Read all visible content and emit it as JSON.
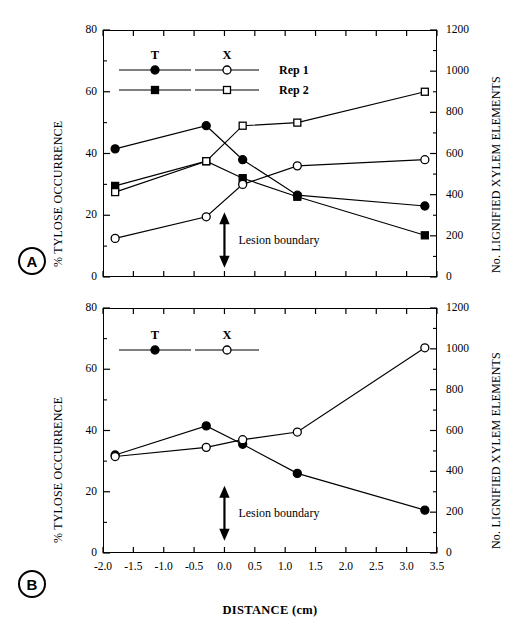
{
  "figure": {
    "panel_a_tag": "A",
    "panel_b_tag": "B",
    "x_axis_title": "DISTANCE (cm)",
    "y_left_title": "% TYLOSE OCCURRENCE",
    "y_right_title": "No. LIGNIFIED XYLEM ELEMENTS",
    "annotation": "Lesion boundary"
  },
  "legend_a": {
    "head_t": "T",
    "head_x": "X",
    "row1": "Rep 1",
    "row2": "Rep 2"
  },
  "legend_b": {
    "head_t": "T",
    "head_x": "X"
  },
  "axes": {
    "x_ticks": [
      "-2.0",
      "-1.5",
      "-1.0",
      "-0.5",
      "0.0",
      "0.5",
      "1.0",
      "1.5",
      "2.0",
      "2.5",
      "3.0",
      "3.5"
    ],
    "y_left_ticks": [
      "0",
      "20",
      "40",
      "60",
      "80"
    ],
    "y_right_ticks": [
      "0",
      "200",
      "400",
      "600",
      "800",
      "1000",
      "1200"
    ]
  },
  "chart_data": [
    {
      "type": "line",
      "panel": "A",
      "title": "",
      "xlabel": "DISTANCE (cm)",
      "ylabel": "% TYLOSE OCCURRENCE",
      "y2label": "No. LIGNIFIED XYLEM ELEMENTS",
      "xlim": [
        -2.0,
        3.5
      ],
      "ylim": [
        0,
        80
      ],
      "y2lim": [
        0,
        1200
      ],
      "grid": false,
      "legend_position": "upper-left-inside",
      "annotations": [
        {
          "text": "Lesion boundary",
          "x": 0.0,
          "type": "double-headed-vertical-arrow"
        }
      ],
      "x": [
        -1.8,
        -0.3,
        0.3,
        1.2,
        3.3
      ],
      "series": [
        {
          "name": "T Rep 1",
          "axis": "left",
          "marker": "filled-circle",
          "values": [
            41.5,
            49.0,
            38.0,
            26.5,
            23.0
          ]
        },
        {
          "name": "T Rep 2",
          "axis": "left",
          "marker": "filled-square",
          "values": [
            29.5,
            37.5,
            32.0,
            26.0,
            13.5
          ]
        },
        {
          "name": "X Rep 1",
          "axis": "right",
          "marker": "open-circle",
          "values": [
            12.5,
            19.5,
            30.0,
            36.0,
            38.0
          ]
        },
        {
          "name": "X Rep 2",
          "axis": "right",
          "marker": "open-square",
          "values": [
            27.5,
            37.5,
            49.0,
            50.0,
            60.0
          ]
        }
      ]
    },
    {
      "type": "line",
      "panel": "B",
      "title": "",
      "xlabel": "DISTANCE (cm)",
      "ylabel": "% TYLOSE OCCURRENCE",
      "y2label": "No. LIGNIFIED XYLEM ELEMENTS",
      "xlim": [
        -2.0,
        3.5
      ],
      "ylim": [
        0,
        80
      ],
      "y2lim": [
        0,
        1200
      ],
      "grid": false,
      "legend_position": "upper-left-inside",
      "annotations": [
        {
          "text": "Lesion boundary",
          "x": 0.0,
          "type": "double-headed-vertical-arrow"
        }
      ],
      "x": [
        -1.8,
        -0.3,
        0.3,
        1.2,
        3.3
      ],
      "series": [
        {
          "name": "T",
          "axis": "left",
          "marker": "filled-circle",
          "values": [
            32.0,
            41.5,
            35.5,
            26.0,
            14.0
          ]
        },
        {
          "name": "X",
          "axis": "right",
          "marker": "open-circle",
          "values": [
            31.5,
            34.5,
            37.0,
            39.5,
            67.0
          ]
        }
      ]
    }
  ]
}
